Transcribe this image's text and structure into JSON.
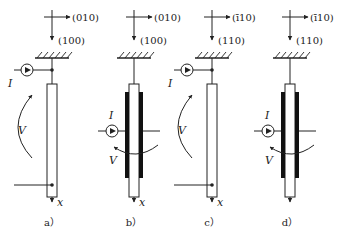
{
  "figure": {
    "panels": [
      {
        "id": "a",
        "caption": "a）",
        "axis_right": "(010)",
        "axis_down": "(100)",
        "current": "I",
        "voltage": "V",
        "position": "x",
        "electrode": "end-contacts",
        "rotation_arrow": "counter-clockwise-left"
      },
      {
        "id": "b",
        "caption": "b）",
        "axis_right": "(010)",
        "axis_down": "(100)",
        "current": "I",
        "voltage": "V",
        "position": "x",
        "electrode": "side-plates",
        "rotation_arrow": "around-rod"
      },
      {
        "id": "c",
        "caption": "c）",
        "axis_right": "(ī10)",
        "axis_down": "(110)",
        "current": "I",
        "voltage": "V",
        "position": "x",
        "electrode": "end-contacts",
        "rotation_arrow": "counter-clockwise-left"
      },
      {
        "id": "d",
        "caption": "d）",
        "axis_right": "(ī10)",
        "axis_down": "(110)",
        "current": "I",
        "voltage": "V",
        "position": "",
        "electrode": "side-plates",
        "rotation_arrow": "around-rod"
      }
    ]
  }
}
